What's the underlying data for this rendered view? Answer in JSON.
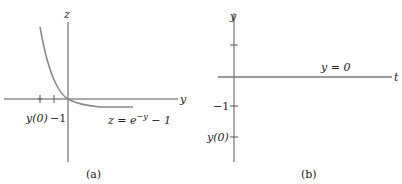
{
  "panel_a": {
    "caption": "(a)",
    "x_axis_label": "y",
    "y_axis_label": "z",
    "tick_labels": {
      "y0": "y(0)",
      "minus_one": "−1"
    },
    "curve_label_prefix": "z = e",
    "curve_label_exp": "−y",
    "curve_label_suffix": " − 1"
  },
  "panel_b": {
    "caption": "(b)",
    "x_axis_label": "t",
    "y_axis_label": "y",
    "tick_labels": {
      "y0": "y(0)",
      "minus_one": "−1"
    },
    "line_label": "y = 0"
  },
  "colors": {
    "axis": "#555555",
    "curve": "#888888",
    "text": "#222222"
  }
}
